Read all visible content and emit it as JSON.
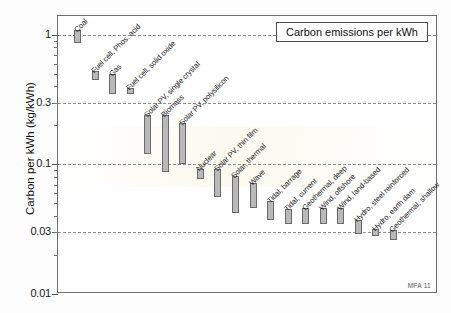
{
  "title": "Carbon emissions per kWh",
  "credit": "MFA 11",
  "axis": {
    "y_title": "Carbon per kWh (kg/kWh)",
    "ticks": [
      "1",
      "0.3",
      "0.1",
      "0.03",
      "0.01"
    ]
  },
  "chart_data": {
    "type": "bar",
    "title": "Carbon emissions per kWh",
    "subtitle": "",
    "xlabel": "",
    "ylabel": "Carbon per kWh (kg/kWh)",
    "yscale": "log",
    "ylim": [
      0.01,
      1.4
    ],
    "ytick_values": [
      1,
      0.3,
      0.1,
      0.03,
      0.01
    ],
    "ytick_labels": [
      "1",
      "0.3",
      "0.1",
      "0.03",
      "0.01"
    ],
    "grid": "horizontal-dashed",
    "legend": "none",
    "note": "Floating range bars: each category spans a low-to-high emissions value.",
    "categories": [
      "Coal",
      "Fuel cell, Phos. acid",
      "Gas",
      "Fuel cell, solid oxide",
      "Solar PV, single crystal",
      "Biomass",
      "Solar PV, polysilicon",
      "Nuclear",
      "Solar PV, thin film",
      "Solar, thermal",
      "Wave",
      "Tidal, barrage",
      "Tidal, current",
      "Geothermal, deep",
      "Wind, offshore",
      "Wind, land-based",
      "Hydro, steel reinforced",
      "Hydro, earth dam",
      "Geothermal, shallow"
    ],
    "ranges": [
      {
        "label": "Coal",
        "low": 0.87,
        "high": 1.1
      },
      {
        "label": "Fuel cell, Phos. acid",
        "low": 0.45,
        "high": 0.53
      },
      {
        "label": "Gas",
        "low": 0.35,
        "high": 0.5
      },
      {
        "label": "Fuel cell, solid oxide",
        "low": 0.35,
        "high": 0.39
      },
      {
        "label": "Solar PV, single crystal",
        "low": 0.12,
        "high": 0.24
      },
      {
        "label": "Biomass",
        "low": 0.088,
        "high": 0.24
      },
      {
        "label": "Solar PV, polysilicon",
        "low": 0.1,
        "high": 0.21
      },
      {
        "label": "Nuclear",
        "low": 0.077,
        "high": 0.092
      },
      {
        "label": "Solar PV, thin film",
        "low": 0.056,
        "high": 0.092
      },
      {
        "label": "Solar, thermal",
        "low": 0.042,
        "high": 0.082
      },
      {
        "label": "Wave",
        "low": 0.046,
        "high": 0.072
      },
      {
        "label": "Tidal, barrage",
        "low": 0.037,
        "high": 0.052
      },
      {
        "label": "Tidal, current",
        "low": 0.035,
        "high": 0.045
      },
      {
        "label": "Geothermal, deep",
        "low": 0.035,
        "high": 0.046
      },
      {
        "label": "Wind, offshore",
        "low": 0.035,
        "high": 0.046
      },
      {
        "label": "Wind, land-based",
        "low": 0.035,
        "high": 0.046
      },
      {
        "label": "Hydro, steel reinforced",
        "low": 0.029,
        "high": 0.037
      },
      {
        "label": "Hydro, earth dam",
        "low": 0.028,
        "high": 0.032
      },
      {
        "label": "Geothermal, shallow",
        "low": 0.026,
        "high": 0.031
      }
    ]
  }
}
